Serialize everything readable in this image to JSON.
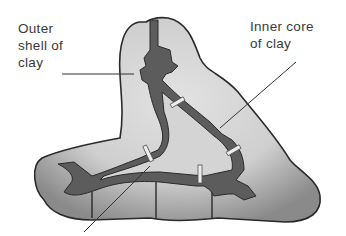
{
  "diagram": {
    "labels": {
      "outer_line1": "Outer",
      "outer_line2": "shell of",
      "outer_line3": "clay",
      "inner_line1": "Inner core",
      "inner_line2": "of clay"
    },
    "colors": {
      "shell_light": "#d6d6d6",
      "shell_shadow": "#8f8f8f",
      "channel_dark": "#5a5a5a",
      "outline": "#2a2a2a",
      "pin": "#e8e8e8",
      "text": "#3a3a3a"
    }
  }
}
